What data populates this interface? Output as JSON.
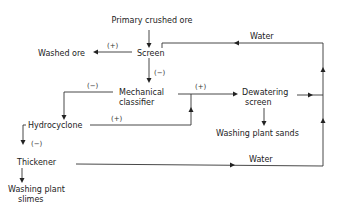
{
  "diagram": {
    "type": "process-flowsheet",
    "nodes": {
      "primary_crushed_ore": "Primary crushed ore",
      "screen": "Screen",
      "washed_ore": "Washed ore",
      "mechanical_classifier_line1": "Mechanical",
      "mechanical_classifier_line2": "classifier",
      "dewatering_screen_line1": "Dewatering",
      "dewatering_screen_line2": "screen",
      "washing_plant_sands": "Washing plant sands",
      "hydrocyclone": "Hydrocyclone",
      "thickener": "Thickener",
      "washing_plant_slimes_line1": "Washing plant",
      "washing_plant_slimes_line2": "slimes"
    },
    "edge_labels": {
      "screen_to_washed_ore": "(+)",
      "screen_to_classifier": "(−)",
      "classifier_to_hydrocyclone": "(−)",
      "classifier_to_dewatering": "(+)",
      "hydrocyclone_to_dewatering": "(+)",
      "hydrocyclone_to_thickener": "(−)",
      "water_top": "Water",
      "water_bottom": "Water"
    },
    "edges": [
      {
        "from": "Primary crushed ore",
        "to": "Screen"
      },
      {
        "from": "Screen",
        "to": "Washed ore",
        "label": "(+)"
      },
      {
        "from": "Screen",
        "to": "Mechanical classifier",
        "label": "(−)"
      },
      {
        "from": "Mechanical classifier",
        "to": "Hydrocyclone",
        "label": "(−)"
      },
      {
        "from": "Mechanical classifier",
        "to": "Dewatering screen",
        "label": "(+)"
      },
      {
        "from": "Hydrocyclone",
        "to": "Dewatering screen",
        "label": "(+)"
      },
      {
        "from": "Hydrocyclone",
        "to": "Thickener",
        "label": "(−)"
      },
      {
        "from": "Dewatering screen",
        "to": "Washing plant sands"
      },
      {
        "from": "Dewatering screen",
        "to": "Screen",
        "label": "Water"
      },
      {
        "from": "Thickener",
        "to": "Screen",
        "label": "Water"
      },
      {
        "from": "Thickener",
        "to": "Washing plant slimes"
      }
    ]
  }
}
